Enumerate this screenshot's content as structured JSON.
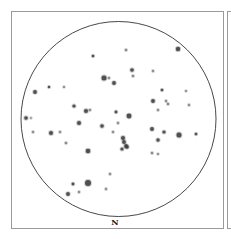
{
  "star_chart": {
    "direction_label": "N",
    "colors": {
      "frame": "#9a9a9a",
      "horizon": "#333333",
      "star": "#3a3a3a",
      "background": "#ffffff"
    },
    "horizon": {
      "cx": 118.5,
      "cy": 119,
      "r": 97.5
    },
    "stars": [
      {
        "x": 93,
        "y": 56,
        "r": 1.3
      },
      {
        "x": 126,
        "y": 50,
        "r": 1.1
      },
      {
        "x": 178,
        "y": 49,
        "r": 2.2
      },
      {
        "x": 132,
        "y": 70,
        "r": 1.8
      },
      {
        "x": 133,
        "y": 76,
        "r": 1.1
      },
      {
        "x": 153,
        "y": 71,
        "r": 1.0
      },
      {
        "x": 104,
        "y": 78,
        "r": 2.5
      },
      {
        "x": 109,
        "y": 78,
        "r": 1.0
      },
      {
        "x": 114,
        "y": 83,
        "r": 1.9
      },
      {
        "x": 35,
        "y": 92,
        "r": 1.9
      },
      {
        "x": 49,
        "y": 87,
        "r": 1.2
      },
      {
        "x": 64,
        "y": 87,
        "r": 0.9
      },
      {
        "x": 162,
        "y": 90,
        "r": 1.3
      },
      {
        "x": 186,
        "y": 91,
        "r": 0.9
      },
      {
        "x": 153,
        "y": 101,
        "r": 1.9
      },
      {
        "x": 166,
        "y": 101,
        "r": 1.0
      },
      {
        "x": 168,
        "y": 104,
        "r": 1.1
      },
      {
        "x": 189,
        "y": 105,
        "r": 1.0
      },
      {
        "x": 158,
        "y": 110,
        "r": 1.0
      },
      {
        "x": 74,
        "y": 106,
        "r": 1.6
      },
      {
        "x": 86,
        "y": 111,
        "r": 2.0
      },
      {
        "x": 90,
        "y": 110,
        "r": 1.0
      },
      {
        "x": 116,
        "y": 112,
        "r": 1.4
      },
      {
        "x": 129,
        "y": 116,
        "r": 2.4
      },
      {
        "x": 26,
        "y": 118,
        "r": 1.8
      },
      {
        "x": 31,
        "y": 118,
        "r": 0.8
      },
      {
        "x": 79,
        "y": 123,
        "r": 2.0
      },
      {
        "x": 118,
        "y": 123,
        "r": 1.0
      },
      {
        "x": 102,
        "y": 126,
        "r": 1.8
      },
      {
        "x": 152,
        "y": 129,
        "r": 1.9
      },
      {
        "x": 33,
        "y": 132,
        "r": 1.0
      },
      {
        "x": 51,
        "y": 133,
        "r": 2.0
      },
      {
        "x": 60,
        "y": 132,
        "r": 1.0
      },
      {
        "x": 113,
        "y": 132,
        "r": 1.0
      },
      {
        "x": 164,
        "y": 132,
        "r": 1.6
      },
      {
        "x": 179,
        "y": 135,
        "r": 2.5
      },
      {
        "x": 196,
        "y": 134,
        "r": 1.3
      },
      {
        "x": 123,
        "y": 138,
        "r": 2.0
      },
      {
        "x": 124,
        "y": 142,
        "r": 1.9
      },
      {
        "x": 126,
        "y": 146,
        "r": 1.9
      },
      {
        "x": 158,
        "y": 140,
        "r": 1.7
      },
      {
        "x": 66,
        "y": 143,
        "r": 1.1
      },
      {
        "x": 127,
        "y": 147,
        "r": 1.8
      },
      {
        "x": 122,
        "y": 149,
        "r": 1.6
      },
      {
        "x": 88,
        "y": 151,
        "r": 2.3
      },
      {
        "x": 152,
        "y": 153,
        "r": 1.1
      },
      {
        "x": 158,
        "y": 154,
        "r": 0.9
      },
      {
        "x": 110,
        "y": 174,
        "r": 1.0
      },
      {
        "x": 73,
        "y": 184,
        "r": 1.4
      },
      {
        "x": 88,
        "y": 183,
        "r": 3.0
      },
      {
        "x": 106,
        "y": 189,
        "r": 1.0
      },
      {
        "x": 68,
        "y": 194,
        "r": 1.9
      },
      {
        "x": 79,
        "y": 192,
        "r": 1.0
      }
    ]
  }
}
